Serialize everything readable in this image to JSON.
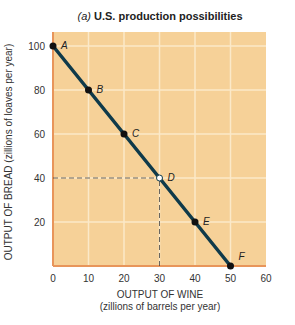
{
  "chart_data": {
    "type": "line",
    "title_prefix": "(a)",
    "title": "U.S. production possibilities",
    "xlabel": "OUTPUT OF WINE",
    "xlabel_sub": "(zillions of barrels per year)",
    "ylabel": "OUTPUT OF BREAD (zillions of loaves per year)",
    "xlim": [
      0,
      60
    ],
    "ylim": [
      0,
      106
    ],
    "x_ticks": [
      0,
      10,
      20,
      30,
      40,
      50,
      60
    ],
    "y_ticks": [
      20,
      40,
      60,
      80,
      100
    ],
    "grid": true,
    "series": [
      {
        "name": "Production possibilities frontier",
        "points": [
          {
            "label": "A",
            "x": 0,
            "y": 100
          },
          {
            "label": "B",
            "x": 10,
            "y": 80
          },
          {
            "label": "C",
            "x": 20,
            "y": 60
          },
          {
            "label": "D",
            "x": 30,
            "y": 40,
            "open": true
          },
          {
            "label": "E",
            "x": 40,
            "y": 20
          },
          {
            "label": "F",
            "x": 50,
            "y": 0
          }
        ]
      }
    ],
    "annotations": [
      {
        "type": "dashed-guide",
        "from": [
          0,
          40
        ],
        "to": [
          30,
          40
        ]
      },
      {
        "type": "dashed-guide",
        "from": [
          30,
          0
        ],
        "to": [
          30,
          40
        ]
      }
    ],
    "colors": {
      "plot_bg": "#f6d198",
      "grid": "#fbe9c9",
      "axis": "#e8955a",
      "line": "#0f3a4a",
      "point": "#111111"
    }
  }
}
